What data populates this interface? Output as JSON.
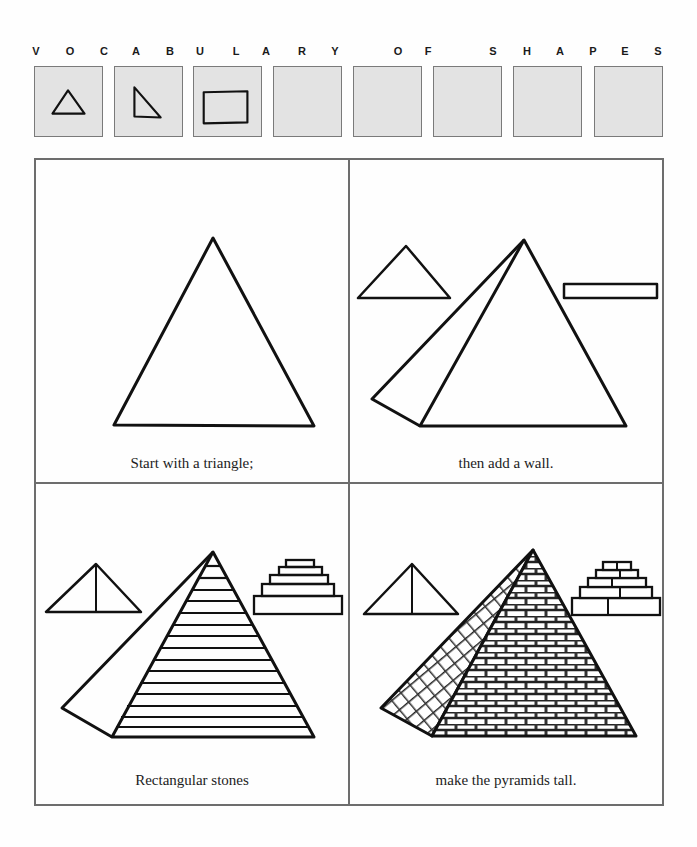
{
  "header": {
    "letters": [
      {
        "char": "V",
        "x": 30
      },
      {
        "char": "O",
        "x": 64
      },
      {
        "char": "C",
        "x": 98
      },
      {
        "char": "A",
        "x": 130
      },
      {
        "char": "B",
        "x": 164
      },
      {
        "char": "U",
        "x": 194
      },
      {
        "char": "L",
        "x": 230
      },
      {
        "char": "A",
        "x": 260
      },
      {
        "char": "R",
        "x": 296
      },
      {
        "char": "Y",
        "x": 329
      },
      {
        "char": "O",
        "x": 392
      },
      {
        "char": "F",
        "x": 422
      },
      {
        "char": "S",
        "x": 487
      },
      {
        "char": "H",
        "x": 521
      },
      {
        "char": "A",
        "x": 554
      },
      {
        "char": "P",
        "x": 587
      },
      {
        "char": "E",
        "x": 619
      },
      {
        "char": "S",
        "x": 652
      }
    ]
  },
  "vocabulary_boxes": [
    {
      "shape": "triangle-icon",
      "x": 34
    },
    {
      "shape": "right-triangle-icon",
      "x": 114
    },
    {
      "shape": "rectangle-icon",
      "x": 193
    },
    {
      "shape": "empty",
      "x": 273
    },
    {
      "shape": "empty",
      "x": 353
    },
    {
      "shape": "empty",
      "x": 433
    },
    {
      "shape": "empty",
      "x": 513
    },
    {
      "shape": "empty",
      "x": 594
    }
  ],
  "panels": [
    {
      "id": "step-1",
      "caption": "Start with a triangle;"
    },
    {
      "id": "step-2",
      "caption": "then add a wall."
    },
    {
      "id": "step-3",
      "caption": "Rectangular stones"
    },
    {
      "id": "step-4",
      "caption": "make the pyramids tall."
    }
  ],
  "colors": {
    "ink": "#111111",
    "box_fill": "#e3e3e3",
    "border": "#6d6d6d"
  }
}
